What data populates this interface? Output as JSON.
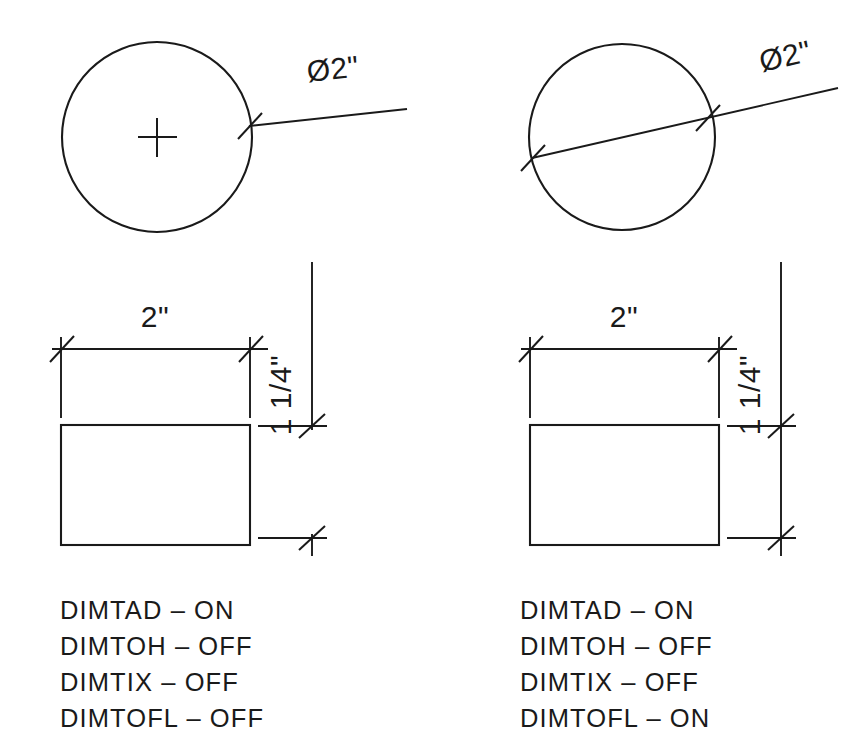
{
  "drawing": {
    "title": "AutoCAD dimension variable comparison",
    "background_color": "#ffffff",
    "line_color": "#1a1a1a"
  },
  "panels": [
    {
      "id": "left",
      "circle": {
        "label": "Ø2\"",
        "leader_style": "radial-outside",
        "center_mark": true,
        "diameter_line_through": false
      },
      "rectangle": {
        "horizontal_dim": "2\"",
        "vertical_dim": "1 1/4\"",
        "dim_line_forced": false
      },
      "notes": [
        {
          "variable": "DIMTAD",
          "dash": "–",
          "state": "ON"
        },
        {
          "variable": "DIMTOH",
          "dash": "–",
          "state": "OFF"
        },
        {
          "variable": "DIMTIX",
          "dash": "–",
          "state": "OFF"
        },
        {
          "variable": "DIMTOFL",
          "dash": "–",
          "state": "OFF"
        }
      ],
      "note_lines": [
        "DIMTAD – ON",
        "DIMTOH – OFF",
        "DIMTIX – OFF",
        "DIMTOFL – OFF"
      ]
    },
    {
      "id": "right",
      "circle": {
        "label": "Ø2\"",
        "leader_style": "diameter-through",
        "center_mark": false,
        "diameter_line_through": true
      },
      "rectangle": {
        "horizontal_dim": "2\"",
        "vertical_dim": "1 1/4\"",
        "dim_line_forced": true
      },
      "notes": [
        {
          "variable": "DIMTAD",
          "dash": "–",
          "state": "ON"
        },
        {
          "variable": "DIMTOH",
          "dash": "–",
          "state": "OFF"
        },
        {
          "variable": "DIMTIX",
          "dash": "–",
          "state": "OFF"
        },
        {
          "variable": "DIMTOFL",
          "dash": "–",
          "state": "ON"
        }
      ],
      "note_lines": [
        "DIMTAD – ON",
        "DIMTOH – OFF",
        "DIMTIX – OFF",
        "DIMTOFL – ON"
      ]
    }
  ]
}
